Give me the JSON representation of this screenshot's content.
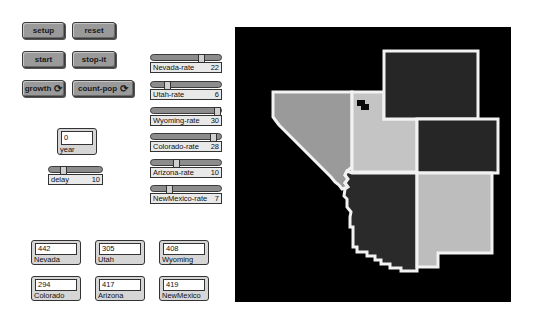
{
  "buttons": {
    "setup": "setup",
    "reset": "reset",
    "start": "start",
    "stop": "stop-it",
    "growth": "growth",
    "count_pop": "count-pop",
    "forever_icon": "⟳"
  },
  "sliders": [
    {
      "label": "Nevada-rate",
      "value": "22",
      "thumb_pct": 68
    },
    {
      "label": "Utah-rate",
      "value": "6",
      "thumb_pct": 18
    },
    {
      "label": "Wyoming-rate",
      "value": "30",
      "thumb_pct": 93
    },
    {
      "label": "Colorado-rate",
      "value": "28",
      "thumb_pct": 86
    },
    {
      "label": "Arizona-rate",
      "value": "10",
      "thumb_pct": 31
    },
    {
      "label": "NewMexico-rate",
      "value": "7",
      "thumb_pct": 22
    }
  ],
  "year_monitor": {
    "label": "year",
    "value": "0"
  },
  "delay_slider": {
    "label": "delay",
    "value": "10",
    "thumb_pct": 22
  },
  "monitors": [
    {
      "label": "Nevada",
      "value": "442"
    },
    {
      "label": "Utah",
      "value": "305"
    },
    {
      "label": "Wyoming",
      "value": "408"
    },
    {
      "label": "Colorado",
      "value": "294"
    },
    {
      "label": "Arizona",
      "value": "417"
    },
    {
      "label": "NewMexico",
      "value": "419"
    }
  ],
  "map": {
    "background": "#000000",
    "border_color": "#f2f2f2",
    "states": [
      {
        "name": "Nevada",
        "color": "#9a9a9a"
      },
      {
        "name": "Utah",
        "color": "#c4c4c4"
      },
      {
        "name": "Wyoming",
        "color": "#262626"
      },
      {
        "name": "Colorado",
        "color": "#262626"
      },
      {
        "name": "Arizona",
        "color": "#2a2a2a"
      },
      {
        "name": "NewMexico",
        "color": "#bdbdbd"
      }
    ],
    "turtle_color": "#0a0a0a"
  }
}
